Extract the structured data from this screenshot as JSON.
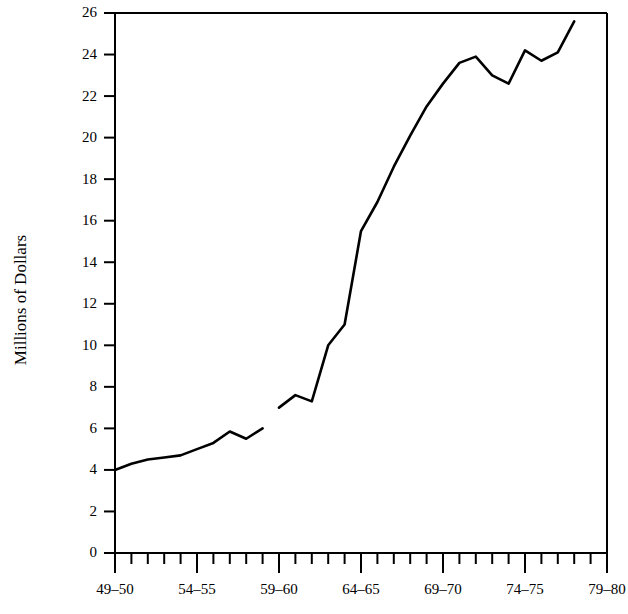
{
  "chart_data": {
    "type": "line",
    "title": "",
    "xlabel": "",
    "ylabel": "Millions of Dollars",
    "ylim": [
      0,
      26
    ],
    "ytick_step": 2,
    "yticks": [
      0,
      2,
      4,
      6,
      8,
      10,
      12,
      14,
      16,
      18,
      20,
      22,
      24,
      26
    ],
    "xticks_major_labels": [
      "49–50",
      "54–55",
      "59–60",
      "64–65",
      "69–70",
      "74–75",
      "79–80"
    ],
    "xticks_major_years": [
      1949,
      1954,
      1959,
      1964,
      1969,
      1974,
      1979
    ],
    "xlim_years": [
      1949,
      1979
    ],
    "minor_tick_interval_years": 1,
    "grid": false,
    "legend": null,
    "line_color": "#000000",
    "axis_color": "#000000",
    "has_data_gap": true,
    "gap_between_x": [
      "58–59",
      "59–60"
    ],
    "x": [
      "49–50",
      "50–51",
      "51–52",
      "52–53",
      "53–54",
      "54–55",
      "55–56",
      "56–57",
      "57–58",
      "58–59",
      "59–60",
      "60–61",
      "61–62",
      "62–63",
      "63–64",
      "64–65",
      "65–66",
      "66–67",
      "67–68",
      "68–69",
      "69–70",
      "70–71",
      "71–72",
      "72–73",
      "73–74",
      "74–75",
      "75–76",
      "76–77",
      "77–78",
      "78–79",
      "79–80"
    ],
    "values": [
      4.0,
      4.3,
      4.5,
      4.6,
      4.7,
      5.0,
      5.3,
      5.85,
      5.5,
      6.0,
      7.0,
      7.6,
      7.3,
      10.0,
      11.0,
      15.5,
      16.9,
      18.6,
      20.1,
      21.5,
      22.6,
      23.6,
      23.9,
      23.0,
      22.6,
      24.2,
      23.7,
      24.1,
      24.1,
      25.6,
      25.6
    ],
    "series_segments": [
      {
        "name": "segment-early",
        "points": [
          {
            "x": "49–50",
            "y": 4.0
          },
          {
            "x": "50–51",
            "y": 4.3
          },
          {
            "x": "51–52",
            "y": 4.5
          },
          {
            "x": "52–53",
            "y": 4.6
          },
          {
            "x": "53–54",
            "y": 4.7
          },
          {
            "x": "54–55",
            "y": 5.0
          },
          {
            "x": "55–56",
            "y": 5.3
          },
          {
            "x": "56–57",
            "y": 5.85
          },
          {
            "x": "57–58",
            "y": 5.5
          },
          {
            "x": "58–59",
            "y": 6.0
          }
        ]
      },
      {
        "name": "segment-late",
        "points": [
          {
            "x": "59–60",
            "y": 7.0
          },
          {
            "x": "60–61",
            "y": 7.6
          },
          {
            "x": "61–62",
            "y": 7.3
          },
          {
            "x": "62–63",
            "y": 10.0
          },
          {
            "x": "63–64",
            "y": 11.0
          },
          {
            "x": "64–65",
            "y": 15.5
          },
          {
            "x": "65–66",
            "y": 16.9
          },
          {
            "x": "66–67",
            "y": 18.6
          },
          {
            "x": "67–68",
            "y": 20.1
          },
          {
            "x": "68–69",
            "y": 21.5
          },
          {
            "x": "69–70",
            "y": 22.6
          },
          {
            "x": "70–71",
            "y": 23.6
          },
          {
            "x": "71–72",
            "y": 23.9
          },
          {
            "x": "72–73",
            "y": 23.0
          },
          {
            "x": "73–74",
            "y": 22.6
          },
          {
            "x": "74–75",
            "y": 24.2
          },
          {
            "x": "75–76",
            "y": 23.7
          },
          {
            "x": "76–77",
            "y": 24.1
          },
          {
            "x": "77–78",
            "y": 25.6
          }
        ]
      }
    ]
  }
}
